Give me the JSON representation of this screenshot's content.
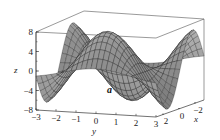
{
  "chart_data": {
    "type": "surface3d",
    "title": "",
    "panel_label": "a",
    "function_hint": "z ≈ 8·sin(x)·cos(y)-like oscillating surface",
    "xlabel": "x",
    "ylabel": "y",
    "zlabel": "z",
    "xlim": [
      -3,
      3
    ],
    "ylim": [
      -3,
      3
    ],
    "zlim": [
      -8,
      8
    ],
    "x_ticks": [
      "2",
      "0",
      "−2"
    ],
    "y_ticks": [
      "−3",
      "−2",
      "−1",
      "0",
      "1",
      "2",
      "3"
    ],
    "z_ticks": [
      "8",
      "4",
      "0",
      "−4",
      "−8"
    ],
    "grid": false,
    "box": true,
    "colormap": "grayscale"
  }
}
